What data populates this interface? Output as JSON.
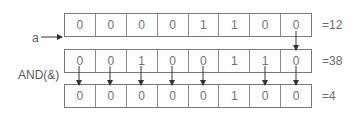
{
  "labels": {
    "a": "a",
    "op": "AND(&)"
  },
  "rows": [
    {
      "name": "operand-a",
      "bits": [
        "0",
        "0",
        "0",
        "0",
        "1",
        "1",
        "0",
        "0"
      ],
      "value": "=12"
    },
    {
      "name": "operand-b",
      "bits": [
        "0",
        "0",
        "1",
        "0",
        "0",
        "1",
        "1",
        "0"
      ],
      "value": "=38"
    },
    {
      "name": "result",
      "bits": [
        "0",
        "0",
        "0",
        "0",
        "0",
        "1",
        "0",
        "0"
      ],
      "value": "=4"
    }
  ],
  "arrows": {
    "a_to_b_columns": [
      7
    ],
    "b_to_result_columns": [
      0,
      1,
      2,
      3,
      4,
      6,
      7
    ]
  }
}
